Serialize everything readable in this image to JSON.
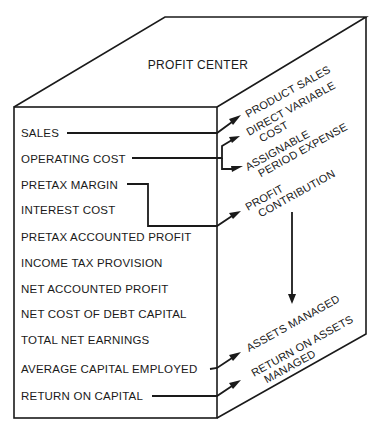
{
  "diagram": {
    "title": "PROFIT CENTER",
    "front_items": [
      {
        "label": "SALES"
      },
      {
        "label": "OPERATING COST"
      },
      {
        "label": "PRETAX MARGIN"
      },
      {
        "label": "INTEREST COST"
      },
      {
        "label": "PRETAX ACCOUNTED PROFIT"
      },
      {
        "label": "INCOME TAX PROVISION"
      },
      {
        "label": "NET ACCOUNTED PROFIT"
      },
      {
        "label": "NET COST OF DEBT CAPITAL"
      },
      {
        "label": "TOTAL NET EARNINGS"
      },
      {
        "label": "AVERAGE CAPITAL EMPLOYED"
      },
      {
        "label": "RETURN ON CAPITAL"
      }
    ],
    "side_items": [
      {
        "lines": [
          "PRODUCT SALES"
        ]
      },
      {
        "lines": [
          "DIRECT VARIABLE",
          "COST"
        ]
      },
      {
        "lines": [
          "ASSIGNABLE",
          "PERIOD EXPENSE"
        ]
      },
      {
        "lines": [
          "PROFIT",
          "CONTRIBUTION"
        ]
      },
      {
        "lines": [
          "ASSETS MANAGED"
        ]
      },
      {
        "lines": [
          "RETURN ON ASSETS",
          "MANAGED"
        ]
      }
    ],
    "connections": [
      {
        "from": "SALES",
        "to": "PRODUCT SALES"
      },
      {
        "from": "OPERATING COST",
        "to": "DIRECT VARIABLE COST"
      },
      {
        "from": "OPERATING COST",
        "to": "ASSIGNABLE PERIOD EXPENSE"
      },
      {
        "from": "PRETAX MARGIN",
        "to": "PROFIT CONTRIBUTION"
      },
      {
        "from": "PROFIT CONTRIBUTION",
        "to": "ASSETS MANAGED"
      },
      {
        "from": "AVERAGE CAPITAL EMPLOYED",
        "to": "ASSETS MANAGED"
      },
      {
        "from": "RETURN ON CAPITAL",
        "to": "RETURN ON ASSETS MANAGED"
      }
    ]
  }
}
